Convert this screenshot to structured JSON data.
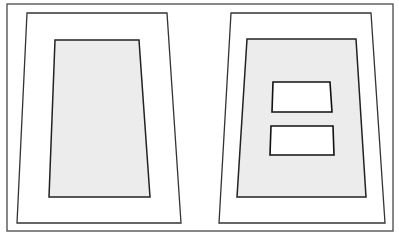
{
  "diagram": {
    "title": "",
    "colors": {
      "background": "#ffffff",
      "line": "#222222",
      "shaded_fill": "#ececec",
      "frame": "#555555"
    },
    "frame": {
      "x": 7,
      "y": 4,
      "width": 386,
      "height": 227
    },
    "panels": [
      {
        "name": "left-panel",
        "outer_trapezoid": "27,13 167,13 181,223 17,223",
        "shaded_area": "55,40 139,40 150,197 49,197",
        "windows": []
      },
      {
        "name": "right-panel",
        "outer_trapezoid": "231,13 371,13 385,223 219,223",
        "shaded_area": "247,39 356,39 366,197 237,197",
        "windows": [
          {
            "name": "upper-window",
            "points": "273,82 330,82 332,112 272,112"
          },
          {
            "name": "lower-window",
            "points": "271,126 333,126 334,155 270,155"
          }
        ]
      }
    ]
  }
}
